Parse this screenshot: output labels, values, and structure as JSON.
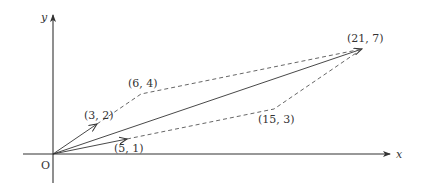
{
  "diagram": {
    "type": "vector-addition",
    "origin_label": "O",
    "axes": {
      "x_label": "x",
      "y_label": "y"
    },
    "points": [
      {
        "id": "a",
        "label": "(3, 2)",
        "x": 3,
        "y": 2
      },
      {
        "id": "b",
        "label": "(5, 1)",
        "x": 5,
        "y": 1
      },
      {
        "id": "c",
        "label": "(6, 4)",
        "x": 6,
        "y": 4
      },
      {
        "id": "d",
        "label": "(15, 3)",
        "x": 15,
        "y": 3
      },
      {
        "id": "e",
        "label": "(21, 7)",
        "x": 21,
        "y": 7
      }
    ],
    "solid_vectors": [
      {
        "from": [
          0,
          0
        ],
        "to": [
          3,
          2
        ]
      },
      {
        "from": [
          0,
          0
        ],
        "to": [
          5,
          1
        ]
      },
      {
        "from": [
          0,
          0
        ],
        "to": [
          21,
          7
        ]
      }
    ],
    "dashed_paths": [
      [
        [
          3,
          2
        ],
        [
          6,
          4
        ],
        [
          21,
          7
        ]
      ],
      [
        [
          5,
          1
        ],
        [
          15,
          3
        ],
        [
          21,
          7
        ]
      ]
    ]
  }
}
